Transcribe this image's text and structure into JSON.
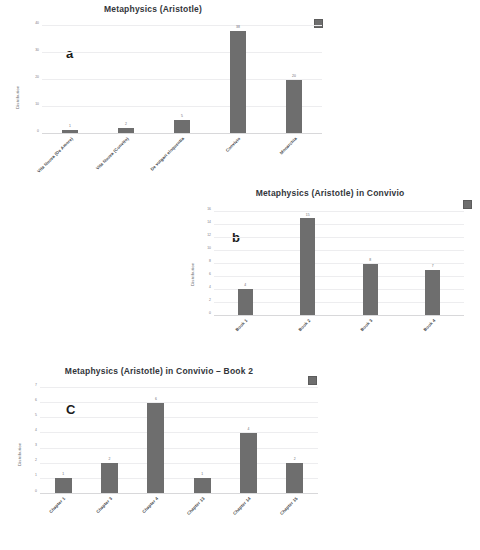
{
  "figure": {
    "background": "#ffffff",
    "bar_color": "#6e6e6e",
    "grid_color": "#ededef"
  },
  "chart_data": [
    {
      "panel": "a",
      "panel_letter": "a",
      "type": "bar",
      "title": "Metaphysics (Aristotle)",
      "xlabel": "",
      "ylabel": "Distribution",
      "ylim": [
        0,
        40
      ],
      "yticks": [
        0,
        10,
        20,
        30,
        40
      ],
      "grid": true,
      "legend_position": "top-right",
      "legend_marker": "gray-square",
      "categories": [
        "Vita Nuova (De Amore)",
        "Vita Nuova (Convito)",
        "De vulgari eloquentia",
        "Convivio",
        "Monarchia"
      ],
      "values": [
        1,
        2,
        5,
        38,
        20
      ],
      "value_labels": [
        "1",
        "2",
        "5",
        "38",
        "20"
      ]
    },
    {
      "panel": "b",
      "panel_letter": "b",
      "type": "bar",
      "title": "Metaphysics (Aristotle) in Convivio",
      "xlabel": "",
      "ylabel": "Distribution",
      "ylim": [
        0,
        16
      ],
      "yticks": [
        0,
        2,
        4,
        6,
        8,
        10,
        12,
        14,
        16
      ],
      "grid": true,
      "legend_position": "top-right",
      "legend_marker": "gray-square",
      "categories": [
        "Book 1",
        "Book 2",
        "Book 3",
        "Book 4"
      ],
      "values": [
        4,
        15,
        8,
        7
      ],
      "value_labels": [
        "4",
        "15",
        "8",
        "7"
      ]
    },
    {
      "panel": "c",
      "panel_letter": "C",
      "type": "bar",
      "title": "Metaphysics (Aristotle) in Convivio – Book 2",
      "xlabel": "",
      "ylabel": "Distribution",
      "ylim": [
        0,
        7
      ],
      "yticks": [
        0,
        1,
        2,
        3,
        4,
        5,
        6,
        7
      ],
      "grid": true,
      "legend_position": "top-right",
      "legend_marker": "gray-square",
      "categories": [
        "Chapter 1",
        "Chapter 3",
        "Chapter 4",
        "Chapter 13",
        "Chapter 14",
        "Chapter 15"
      ],
      "values": [
        1,
        2,
        6,
        1,
        4,
        2
      ],
      "value_labels": [
        "1",
        "2",
        "6",
        "1",
        "4",
        "2"
      ]
    }
  ]
}
